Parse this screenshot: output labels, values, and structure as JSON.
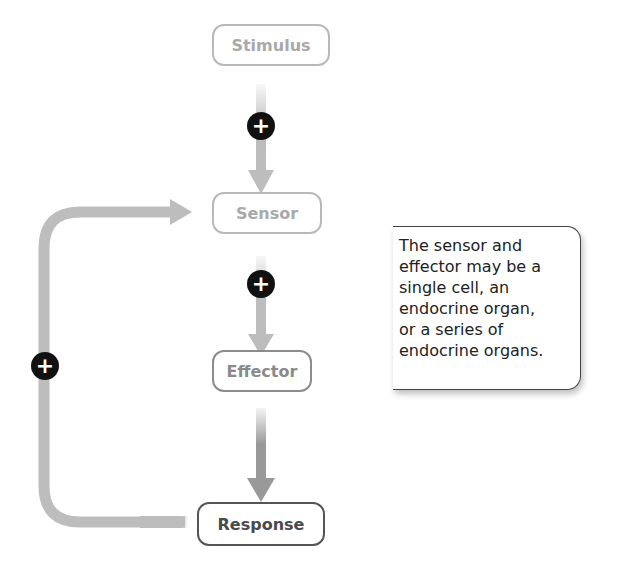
{
  "diagram": {
    "type": "positive-feedback-loop",
    "nodes": [
      {
        "id": "stimulus",
        "label": "Stimulus"
      },
      {
        "id": "sensor",
        "label": "Sensor"
      },
      {
        "id": "effector",
        "label": "Effector"
      },
      {
        "id": "response",
        "label": "Response"
      }
    ],
    "signs": [
      {
        "between": "stimulus-sensor",
        "symbol": "+"
      },
      {
        "between": "sensor-effector",
        "symbol": "+"
      },
      {
        "between": "response-sensor",
        "symbol": "+"
      }
    ],
    "note": {
      "lines": [
        "The sensor and",
        "effector may be a",
        "single cell, an",
        "endocrine organ,",
        "or a series of",
        "endocrine organs."
      ]
    }
  }
}
